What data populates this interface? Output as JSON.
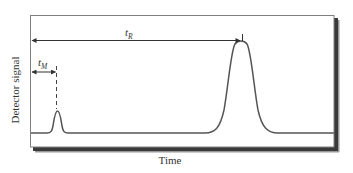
{
  "diagram": {
    "type": "chromatogram",
    "y_axis_label": "Detector signal",
    "x_axis_label": "Time",
    "annotations": {
      "t_m": {
        "symbol": "t",
        "subscript": "M",
        "description": "dead time (unretained peak)"
      },
      "t_r": {
        "symbol": "t",
        "subscript": "R",
        "description": "retention time"
      }
    },
    "peaks": [
      {
        "name": "unretained",
        "label": "t_M",
        "relative_position": 0.09,
        "relative_height": 0.24
      },
      {
        "name": "analyte",
        "label": "t_R",
        "relative_position": 0.69,
        "relative_height": 0.98
      }
    ],
    "colors": {
      "line": "#555555",
      "frame": "#7a7a7a",
      "shadow": "#333333",
      "text": "#333333"
    }
  }
}
